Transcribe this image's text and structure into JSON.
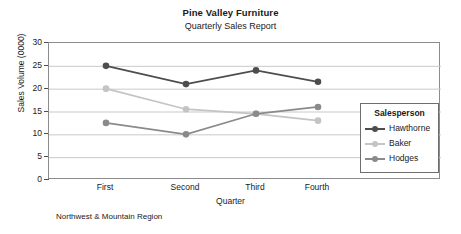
{
  "chart_data": {
    "type": "line",
    "title": "Pine Valley Furniture",
    "subtitle": "Quarterly Sales Report",
    "xlabel": "Quarter",
    "ylabel": "Sales Volume (0000)",
    "footnote": "Northwest & Mountain Region",
    "categories": [
      "First",
      "Second",
      "Third",
      "Fourth"
    ],
    "ylim": [
      0,
      30
    ],
    "yticks": [
      0,
      5,
      10,
      15,
      20,
      25,
      30
    ],
    "grid": true,
    "legend_position": "inside-right",
    "legend_title": "Salesperson",
    "series": [
      {
        "name": "Hawthorne",
        "values": [
          25,
          21,
          24,
          21.5
        ],
        "color": "#4d4d4d"
      },
      {
        "name": "Baker",
        "values": [
          20,
          15.5,
          14.5,
          13
        ],
        "color": "#c4c4c4"
      },
      {
        "name": "Hodges",
        "values": [
          12.5,
          10,
          14.5,
          16
        ],
        "color": "#8a8a8a"
      }
    ]
  }
}
